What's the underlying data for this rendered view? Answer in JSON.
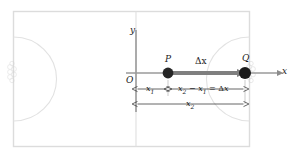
{
  "figure": {
    "type": "physics-displacement-diagram",
    "background_color": "#ffffff",
    "frame_color": "#d9d9d9",
    "field_line_color": "#e0e0e0",
    "axis_color": "#8c8c8c",
    "marker_color": "#262626",
    "arrow_color": "#808080",
    "dimension_color": "#404040"
  },
  "axes": {
    "x_label": "x",
    "y_label": "y",
    "origin_label": "O"
  },
  "points": [
    {
      "id": "P",
      "label": "P",
      "x_px": 168,
      "y_px": 73
    },
    {
      "id": "Q",
      "label": "Q",
      "x_px": 245,
      "y_px": 73
    }
  ],
  "displacement": {
    "label": "Δx",
    "from": "P",
    "to": "Q"
  },
  "dimensions": [
    {
      "id": "x1",
      "label_main": "x",
      "label_sub": "1",
      "text": "x₁",
      "from_px": 136,
      "to_px": 168
    },
    {
      "id": "x2-x1",
      "text": "x₂ − x₁ = Δx",
      "parts": [
        {
          "t": "x",
          "italic": true
        },
        {
          "t": "2",
          "sub": true
        },
        {
          "t": " − ",
          "italic": false
        },
        {
          "t": "x",
          "italic": true
        },
        {
          "t": "1",
          "sub": true
        },
        {
          "t": " = ",
          "italic": false
        },
        {
          "t": "Δ",
          "italic": false
        },
        {
          "t": "x",
          "italic": true
        }
      ],
      "from_px": 168,
      "to_px": 245
    },
    {
      "id": "x2",
      "label_main": "x",
      "label_sub": "2",
      "text": "x₂",
      "from_px": 136,
      "to_px": 245
    }
  ],
  "field": {
    "outer_frame": {
      "x": 13,
      "y": 11,
      "width": 237,
      "height": 136
    },
    "halfway_line_x": 136,
    "left_arc": true,
    "right_arc": true,
    "left_marker_cluster_x": 13,
    "right_marker_cluster_x": 250
  }
}
